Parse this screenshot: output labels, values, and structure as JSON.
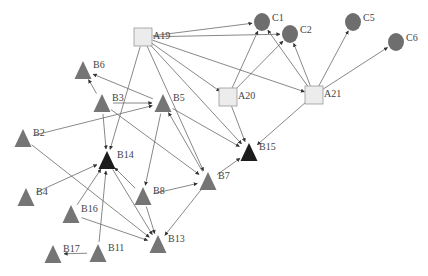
{
  "diagram": {
    "type": "directed-network",
    "colors": {
      "square_fill": "#ececec",
      "square_stroke": "#9a9a9a",
      "circle_fill": "#6e6e6e",
      "triangle_fill": "#757575",
      "triangle_dark_fill": "#1c1c1c",
      "edge": "#6a6a6a"
    },
    "nodes": [
      {
        "id": "A19",
        "label": "A19",
        "shape": "square",
        "x": 143,
        "y": 37
      },
      {
        "id": "A20",
        "label": "A20",
        "shape": "square",
        "x": 228,
        "y": 97
      },
      {
        "id": "A21",
        "label": "A21",
        "shape": "square",
        "x": 314,
        "y": 95
      },
      {
        "id": "C1",
        "label": "C1",
        "shape": "circle",
        "x": 262,
        "y": 22
      },
      {
        "id": "C2",
        "label": "C2",
        "shape": "circle",
        "x": 290,
        "y": 34
      },
      {
        "id": "C5",
        "label": "C5",
        "shape": "circle",
        "x": 353,
        "y": 22
      },
      {
        "id": "C6",
        "label": "C6",
        "shape": "circle",
        "x": 396,
        "y": 42
      },
      {
        "id": "B6",
        "label": "B6",
        "shape": "triangle",
        "x": 83,
        "y": 70
      },
      {
        "id": "B3",
        "label": "B3",
        "shape": "triangle",
        "x": 102,
        "y": 103
      },
      {
        "id": "B5",
        "label": "B5",
        "shape": "triangle",
        "x": 163,
        "y": 103
      },
      {
        "id": "B2",
        "label": "B2",
        "shape": "triangle",
        "x": 23,
        "y": 138
      },
      {
        "id": "B14",
        "label": "B14",
        "shape": "triangle-dark",
        "x": 107,
        "y": 160
      },
      {
        "id": "B15",
        "label": "B15",
        "shape": "triangle-dark",
        "x": 249,
        "y": 152
      },
      {
        "id": "B7",
        "label": "B7",
        "shape": "triangle",
        "x": 208,
        "y": 181
      },
      {
        "id": "B4",
        "label": "B4",
        "shape": "triangle",
        "x": 26,
        "y": 197
      },
      {
        "id": "B8",
        "label": "B8",
        "shape": "triangle",
        "x": 143,
        "y": 196
      },
      {
        "id": "B16",
        "label": "B16",
        "shape": "triangle",
        "x": 71,
        "y": 214
      },
      {
        "id": "B13",
        "label": "B13",
        "shape": "triangle",
        "x": 158,
        "y": 244
      },
      {
        "id": "B17",
        "label": "B17",
        "shape": "triangle",
        "x": 53,
        "y": 254
      },
      {
        "id": "B11",
        "label": "B11",
        "shape": "triangle",
        "x": 98,
        "y": 253
      }
    ],
    "edges": [
      {
        "from": "A19",
        "to": "C1"
      },
      {
        "from": "A19",
        "to": "C2"
      },
      {
        "from": "A19",
        "to": "A20"
      },
      {
        "from": "A19",
        "to": "A21"
      },
      {
        "from": "A19",
        "to": "B15"
      },
      {
        "from": "A19",
        "to": "B14"
      },
      {
        "from": "A19",
        "to": "B7"
      },
      {
        "from": "A20",
        "to": "C1"
      },
      {
        "from": "A20",
        "to": "C2"
      },
      {
        "from": "A20",
        "to": "B15"
      },
      {
        "from": "A21",
        "to": "C1"
      },
      {
        "from": "A21",
        "to": "C2"
      },
      {
        "from": "A21",
        "to": "C5"
      },
      {
        "from": "A21",
        "to": "C6"
      },
      {
        "from": "A21",
        "to": "B15"
      },
      {
        "from": "B5",
        "to": "B6"
      },
      {
        "from": "B3",
        "to": "B6"
      },
      {
        "from": "B3",
        "to": "B5"
      },
      {
        "from": "B2",
        "to": "B5"
      },
      {
        "from": "B5",
        "to": "B15"
      },
      {
        "from": "B3",
        "to": "B14"
      },
      {
        "from": "B3",
        "to": "B7"
      },
      {
        "from": "B7",
        "to": "B5"
      },
      {
        "from": "B5",
        "to": "B8"
      },
      {
        "from": "B7",
        "to": "B15"
      },
      {
        "from": "B8",
        "to": "B7"
      },
      {
        "from": "B8",
        "to": "B14"
      },
      {
        "from": "B8",
        "to": "B13"
      },
      {
        "from": "B7",
        "to": "B13"
      },
      {
        "from": "B2",
        "to": "B13"
      },
      {
        "from": "B4",
        "to": "B14"
      },
      {
        "from": "B16",
        "to": "B14"
      },
      {
        "from": "B16",
        "to": "B13"
      },
      {
        "from": "B11",
        "to": "B14"
      },
      {
        "from": "B11",
        "to": "B17"
      },
      {
        "from": "B14",
        "to": "B13"
      }
    ]
  }
}
